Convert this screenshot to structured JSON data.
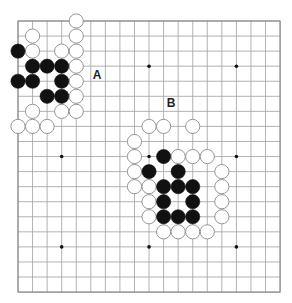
{
  "board": {
    "size": 19,
    "origin_x": 18,
    "origin_y": 21,
    "spacing_x": 14.56,
    "spacing_y": 15.06,
    "stone_radius": 7.1,
    "colors": {
      "background": "#ffffff",
      "grid": "#a0a0a0",
      "black_stone": "#111111",
      "white_stone_fill": "#ffffff",
      "white_stone_outline": "#8a8a8a"
    },
    "hoshi": [
      [
        3,
        3
      ],
      [
        9,
        3
      ],
      [
        15,
        3
      ],
      [
        3,
        9
      ],
      [
        9,
        9
      ],
      [
        15,
        9
      ],
      [
        3,
        15
      ],
      [
        9,
        15
      ],
      [
        15,
        15
      ]
    ],
    "black_stones": [
      [
        0,
        2
      ],
      [
        1,
        3
      ],
      [
        2,
        3
      ],
      [
        3,
        3
      ],
      [
        0,
        4
      ],
      [
        1,
        4
      ],
      [
        3,
        4
      ],
      [
        2,
        5
      ],
      [
        3,
        5
      ],
      [
        10,
        9
      ],
      [
        9,
        10
      ],
      [
        11,
        10
      ],
      [
        10,
        11
      ],
      [
        11,
        11
      ],
      [
        12,
        11
      ],
      [
        10,
        12
      ],
      [
        12,
        12
      ],
      [
        10,
        13
      ],
      [
        11,
        13
      ],
      [
        12,
        13
      ]
    ],
    "white_stones": [
      [
        4,
        0
      ],
      [
        1,
        1
      ],
      [
        4,
        1
      ],
      [
        1,
        2
      ],
      [
        3,
        2
      ],
      [
        4,
        2
      ],
      [
        4,
        3
      ],
      [
        4,
        4
      ],
      [
        4,
        5
      ],
      [
        1,
        6
      ],
      [
        3,
        6
      ],
      [
        4,
        6
      ],
      [
        0,
        7
      ],
      [
        1,
        7
      ],
      [
        2,
        7
      ],
      [
        9,
        7
      ],
      [
        10,
        7
      ],
      [
        12,
        7
      ],
      [
        8,
        8
      ],
      [
        8,
        9
      ],
      [
        11,
        9
      ],
      [
        12,
        9
      ],
      [
        13,
        9
      ],
      [
        8,
        10
      ],
      [
        14,
        10
      ],
      [
        8,
        11
      ],
      [
        9,
        11
      ],
      [
        14,
        11
      ],
      [
        9,
        12
      ],
      [
        14,
        12
      ],
      [
        9,
        13
      ],
      [
        14,
        13
      ],
      [
        10,
        14
      ],
      [
        11,
        14
      ],
      [
        12,
        14
      ],
      [
        13,
        14
      ]
    ]
  },
  "labels": [
    {
      "id": "label-a",
      "text": "A",
      "x": 97,
      "y": 79
    },
    {
      "id": "label-b",
      "text": "B",
      "x": 171,
      "y": 107
    }
  ]
}
